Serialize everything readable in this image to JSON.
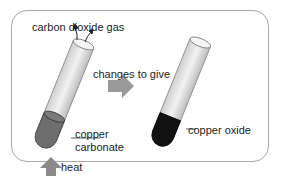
{
  "diagram": {
    "labels": {
      "gas": "carbon dioxide gas",
      "arrow": "changes to give",
      "reactant_line1": "copper",
      "reactant_line2": "carbonate",
      "product": "copper oxide",
      "heat": "heat"
    },
    "colors": {
      "frame": "#a8a8a8",
      "tube_glass": "#e6e6e6",
      "reactant": "#6e6e6e",
      "product": "#111111",
      "arrow": "#8a8a8a"
    }
  }
}
